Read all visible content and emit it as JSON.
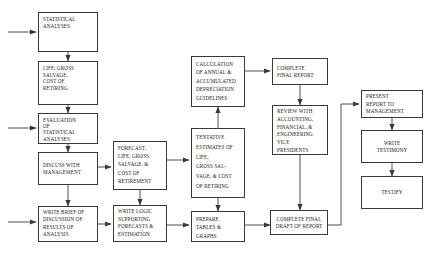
{
  "diagram": {
    "type": "flowchart",
    "background_color": "#ffffff",
    "box_border_color": "#3a3a3a",
    "connector_color": "#3a3a3a"
  },
  "nodes": {
    "statistical_analyses": "STATISTICAL ANALYSES",
    "life_gross_salvage": "LIFE, GROSS SALVAGE, COST OF RETIRING",
    "evaluation": "EVALUATION OF STATISTICAL ANALYSES",
    "discuss_management": "DISCUSS WITH MANAGEMENT",
    "write_brief": "WRITE BRIEF OF DISCUSSION OF RESULTS OF ANALYSIS",
    "forecast": "FORECAST: LIFE, GROSS SALVAGE, & COST OF RETIREMENT",
    "write_logic": "WRITE LOGIC SUPPORTING FORECASTS & ESTIMATION",
    "calculation": "CALCULATION OF ANNUAL & ACCUMULATED DEPRECIATION GUIDELINES",
    "tentative_estimates": "TENTATIVE ESTIMATES OF LIFE, GROSS SAL-VAGE, & COST OF RETIRING",
    "prepare_tables": "PREPARE TABLES & GRAPHS",
    "complete_final_report": "COMPLETE FINAL REPORT",
    "review_with": "REVIEW WITH ACCOUNTING, FINANCIAL, & ENGINEERING VICE PRESIDENTS",
    "complete_final_draft": "COMPLETE FINAL DRAFT OF REPORT",
    "present_report": "PRESENT REPORT TO MANAGEMENT",
    "write_testimony": "WRITE TESTIMONY",
    "testify": "TESTIFY"
  },
  "node_lines": {
    "statistical_analyses": [
      "STATISTICAL",
      "ANALYSES"
    ],
    "life_gross_salvage": [
      "LIFE, GROSS",
      "SALVAGE,",
      "COST OF",
      "RETIRING"
    ],
    "evaluation": [
      "EVALUATION",
      "OF",
      "STATISTICAL",
      "ANALYSES"
    ],
    "discuss_management": [
      "DISCUSS WITH",
      "MANAGEMENT"
    ],
    "write_brief": [
      "WRITE BRIEF OF",
      "DISCUSSION OF",
      "RESULTS OF",
      "ANALYSIS"
    ],
    "forecast": [
      "FORECAST:",
      "LIFE, GROSS",
      "SALVAGE, &",
      "COST OF",
      "RETIREMENT"
    ],
    "write_logic": [
      "WRITE LOGIC",
      "SUPPORTING",
      "FORECASTS &",
      "ESTIMATION"
    ],
    "calculation": [
      "CALCULATION",
      "OF ANNUAL &",
      "ACCUMULATED",
      "DEPRECIATION",
      "GUIDELINES"
    ],
    "tentative_estimates": [
      "TENTATIVE",
      "ESTIMATES OF",
      "LIFE,",
      "GROSS SAL-",
      "VAGE, & COST",
      "OF RETIRING"
    ],
    "prepare_tables": [
      "PREPARE",
      "TABLES &",
      "GRAPHS"
    ],
    "complete_final_report": [
      "COMPLETE",
      "FINAL REPORT"
    ],
    "review_with": [
      "REVIEW WITH",
      "ACCOUNTING,",
      "FINANCIAL, &",
      "ENGINEERING",
      "VICE",
      "PRESIDENTS"
    ],
    "complete_final_draft": [
      "COMPLETE FINAL",
      "DRAFT OF REPORT"
    ],
    "present_report": [
      "PRESENT",
      "REPORT TO",
      "MANAGEMENT"
    ],
    "write_testimony": [
      "WRITE",
      "TESTIMONY"
    ],
    "testify": [
      "TESTIFY"
    ]
  },
  "edges": [
    {
      "from": "external-input-1",
      "to": "statistical_analyses",
      "style": "arrow"
    },
    {
      "from": "statistical_analyses",
      "to": "life_gross_salvage",
      "style": "arrow"
    },
    {
      "from": "life_gross_salvage",
      "to": "evaluation",
      "style": "arrow"
    },
    {
      "from": "external-input-2",
      "to": "evaluation",
      "style": "arrow"
    },
    {
      "from": "evaluation",
      "to": "discuss_management",
      "style": "arrow"
    },
    {
      "from": "discuss_management",
      "to": "write_brief",
      "style": "arrow"
    },
    {
      "from": "discuss_management",
      "to": "forecast",
      "style": "arrow"
    },
    {
      "from": "external-input-3",
      "to": "write_brief",
      "style": "arrow"
    },
    {
      "from": "write_brief",
      "to": "write_logic",
      "style": "arrow"
    },
    {
      "from": "forecast",
      "to": "write_logic",
      "style": "arrow"
    },
    {
      "from": "forecast",
      "to": "tentative_estimates",
      "style": "arrow"
    },
    {
      "from": "tentative_estimates",
      "to": "calculation",
      "style": "arrow"
    },
    {
      "from": "tentative_estimates",
      "to": "prepare_tables",
      "style": "arrow"
    },
    {
      "from": "write_logic",
      "to": "prepare_tables",
      "style": "arrow"
    },
    {
      "from": "calculation",
      "to": "complete_final_report",
      "style": "arrow"
    },
    {
      "from": "complete_final_report",
      "to": "review_with",
      "style": "arrow"
    },
    {
      "from": "review_with",
      "to": "complete_final_draft",
      "style": "arrow"
    },
    {
      "from": "prepare_tables",
      "to": "complete_final_draft",
      "style": "arrow"
    },
    {
      "from": "complete_final_draft",
      "to": "present_report",
      "style": "arrow-routed"
    },
    {
      "from": "present_report",
      "to": "write_testimony",
      "style": "arrow"
    },
    {
      "from": "write_testimony",
      "to": "testify",
      "style": "arrow"
    }
  ]
}
